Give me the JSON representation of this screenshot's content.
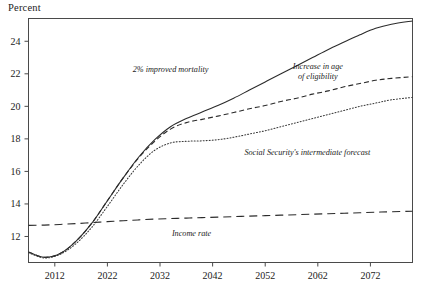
{
  "chart_data": {
    "type": "line",
    "title": "",
    "ylabel": "Percent",
    "xlabel": "",
    "xlim": [
      2007,
      2080
    ],
    "ylim": [
      10.4,
      25.4
    ],
    "grid": false,
    "legend_position": "inline-annotations",
    "xticks": [
      "2012",
      "2022",
      "2032",
      "2042",
      "2052",
      "2062",
      "2072"
    ],
    "xtick_values": [
      2012,
      2022,
      2032,
      2042,
      2052,
      2062,
      2072
    ],
    "yticks": [
      "12",
      "14",
      "16",
      "18",
      "20",
      "22",
      "24"
    ],
    "ytick_values": [
      12,
      14,
      16,
      18,
      20,
      22,
      24
    ],
    "x": [
      2007,
      2010,
      2013,
      2016,
      2019,
      2022,
      2025,
      2028,
      2031,
      2034,
      2037,
      2040,
      2043,
      2046,
      2049,
      2052,
      2055,
      2058,
      2061,
      2064,
      2067,
      2070,
      2073,
      2076,
      2080
    ],
    "series": [
      {
        "name": "2% improved mortality",
        "style": "solid",
        "color": "#2b2b2b",
        "label_x": 2034,
        "label_y": 22.1,
        "values": [
          11.05,
          10.72,
          10.95,
          11.7,
          12.8,
          14.2,
          15.6,
          16.9,
          17.95,
          18.75,
          19.25,
          19.65,
          20.05,
          20.5,
          21.0,
          21.5,
          22.0,
          22.5,
          23.0,
          23.5,
          23.95,
          24.4,
          24.8,
          25.05,
          25.25
        ]
      },
      {
        "name": "Increase in age of eligibility",
        "style": "dashed",
        "color": "#2b2b2b",
        "label_x": 2062,
        "label_y": 22.3,
        "values": [
          11.05,
          10.72,
          10.95,
          11.7,
          12.8,
          14.2,
          15.6,
          16.85,
          17.85,
          18.6,
          19.0,
          19.2,
          19.4,
          19.62,
          19.85,
          20.05,
          20.3,
          20.5,
          20.75,
          20.95,
          21.2,
          21.4,
          21.6,
          21.72,
          21.82
        ]
      },
      {
        "name": "Social Security's intermediate forecast",
        "style": "dotted",
        "color": "#3a3a3a",
        "label_x": 2060,
        "label_y": 17.0,
        "values": [
          11.0,
          10.68,
          10.9,
          11.55,
          12.55,
          13.85,
          15.2,
          16.4,
          17.3,
          17.75,
          17.85,
          17.88,
          17.95,
          18.1,
          18.3,
          18.5,
          18.75,
          19.0,
          19.25,
          19.5,
          19.75,
          20.0,
          20.2,
          20.4,
          20.55
        ]
      },
      {
        "name": "Income rate",
        "style": "longdash",
        "color": "#2b2b2b",
        "label_x": 2038,
        "label_y": 12.05,
        "values": [
          12.68,
          12.7,
          12.74,
          12.79,
          12.85,
          12.91,
          12.97,
          13.02,
          13.07,
          13.1,
          13.13,
          13.16,
          13.19,
          13.22,
          13.25,
          13.28,
          13.31,
          13.34,
          13.37,
          13.4,
          13.43,
          13.46,
          13.49,
          13.52,
          13.55
        ]
      }
    ],
    "annotations": [
      {
        "id": "ann-improved-mortality",
        "text": "2% improved mortality"
      },
      {
        "id": "ann-eligibility-line1",
        "text": "Increase in age"
      },
      {
        "id": "ann-eligibility-line2",
        "text": "of eligibility"
      },
      {
        "id": "ann-ss-forecast",
        "text": "Social Security's intermediate forecast"
      },
      {
        "id": "ann-income-rate",
        "text": "Income rate"
      }
    ]
  },
  "axis": {
    "percent_label": "Percent"
  }
}
